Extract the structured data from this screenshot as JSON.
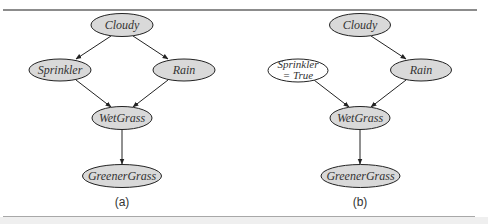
{
  "colors": {
    "node_fill": "#d9d9d9",
    "node_fill_observed": "#ffffff",
    "node_stroke": "#222222",
    "edge": "#222222",
    "rule": "#8c8c8c"
  },
  "diagrams": [
    {
      "caption": "(a)",
      "nodes": {
        "cloudy": "Cloudy",
        "sprinkler": "Sprinkler",
        "rain": "Rain",
        "wetgrass": "WetGrass",
        "greenergrass": "GreenerGrass"
      },
      "edges": [
        [
          "Cloudy",
          "Sprinkler"
        ],
        [
          "Cloudy",
          "Rain"
        ],
        [
          "Sprinkler",
          "WetGrass"
        ],
        [
          "Rain",
          "WetGrass"
        ],
        [
          "WetGrass",
          "GreenerGrass"
        ]
      ]
    },
    {
      "caption": "(b)",
      "nodes": {
        "cloudy": "Cloudy",
        "sprinkler_line1": "Sprinkler",
        "sprinkler_line2": "= True",
        "rain": "Rain",
        "wetgrass": "WetGrass",
        "greenergrass": "GreenerGrass"
      },
      "edges": [
        [
          "Cloudy",
          "Rain"
        ],
        [
          "Sprinkler = True",
          "WetGrass"
        ],
        [
          "Rain",
          "WetGrass"
        ],
        [
          "WetGrass",
          "GreenerGrass"
        ]
      ]
    }
  ]
}
